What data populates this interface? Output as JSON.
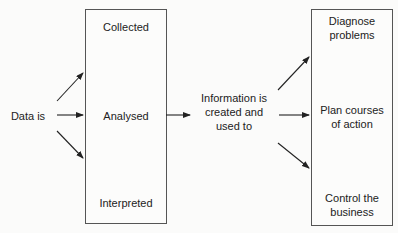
{
  "diagram": {
    "source": {
      "label": "Data is"
    },
    "left_box": {
      "items": [
        "Collected",
        "Analysed",
        "Interpreted"
      ]
    },
    "middle": {
      "label_lines": [
        "Information is",
        "created and",
        "used to"
      ]
    },
    "right_box": {
      "items": [
        {
          "lines": [
            "Diagnose",
            "problems"
          ]
        },
        {
          "lines": [
            "Plan courses",
            "of action"
          ]
        },
        {
          "lines": [
            "Control the",
            "business"
          ]
        }
      ]
    },
    "colors": {
      "line": "#222222",
      "box_border": "#555555",
      "background": "#fbfbfa"
    }
  }
}
